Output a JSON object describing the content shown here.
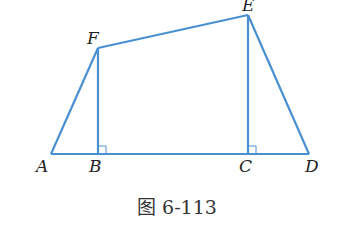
{
  "diagram": {
    "stroke_color": "#4a90d0",
    "points": {
      "A": {
        "label": "A",
        "x": 51,
        "y": 154
      },
      "B": {
        "label": "B",
        "x": 98,
        "y": 154
      },
      "C": {
        "label": "C",
        "x": 247,
        "y": 154
      },
      "D": {
        "label": "D",
        "x": 309,
        "y": 154
      },
      "E": {
        "label": "E",
        "x": 248,
        "y": 15
      },
      "F": {
        "label": "F",
        "x": 98,
        "y": 48
      }
    },
    "segments": [
      "AF",
      "FE",
      "ED",
      "AD",
      "FB",
      "EC"
    ],
    "right_angles": [
      "FBC",
      "ECD"
    ],
    "caption": "图 6-113"
  }
}
